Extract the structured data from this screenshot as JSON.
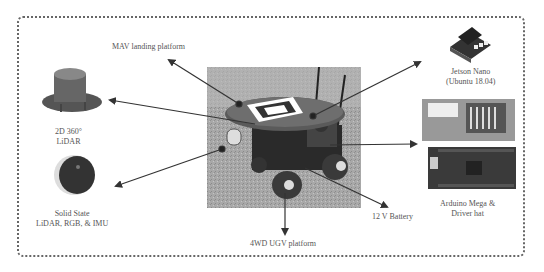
{
  "diagram": {
    "center_image": "ugv-robot-photo",
    "components": [
      {
        "id": "mav",
        "label_lines": [
          "MAV landing platform"
        ]
      },
      {
        "id": "lidar2d",
        "label_lines": [
          "2D 360°",
          "LiDAR"
        ]
      },
      {
        "id": "solid_state",
        "label_lines": [
          "Solid State",
          "LiDAR, RGB, & IMU"
        ]
      },
      {
        "id": "ugv",
        "label_lines": [
          "4WD UGV platform"
        ]
      },
      {
        "id": "battery",
        "label_lines": [
          "12 V Battery"
        ]
      },
      {
        "id": "jetson",
        "label_lines": [
          "Jetson Nano",
          "(Ubuntu 18.04)"
        ]
      },
      {
        "id": "arduino",
        "label_lines": [
          "Arduino Mega &",
          "Driver hat"
        ]
      }
    ]
  }
}
